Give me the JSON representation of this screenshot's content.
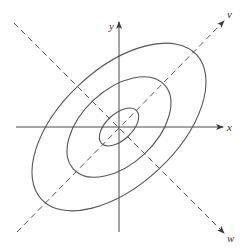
{
  "diagram": {
    "axes": {
      "x_label": "x",
      "y_label": "y",
      "v_label": "v",
      "w_label": "w"
    },
    "principal_axis_angle_deg": 45,
    "contours": [
      {
        "name": "inner",
        "level": 1
      },
      {
        "name": "middle",
        "level": 2
      },
      {
        "name": "outer",
        "level": 3
      }
    ],
    "colors": {
      "line": "#555555",
      "axis": "#4a4a4a",
      "text": "#333333"
    }
  }
}
